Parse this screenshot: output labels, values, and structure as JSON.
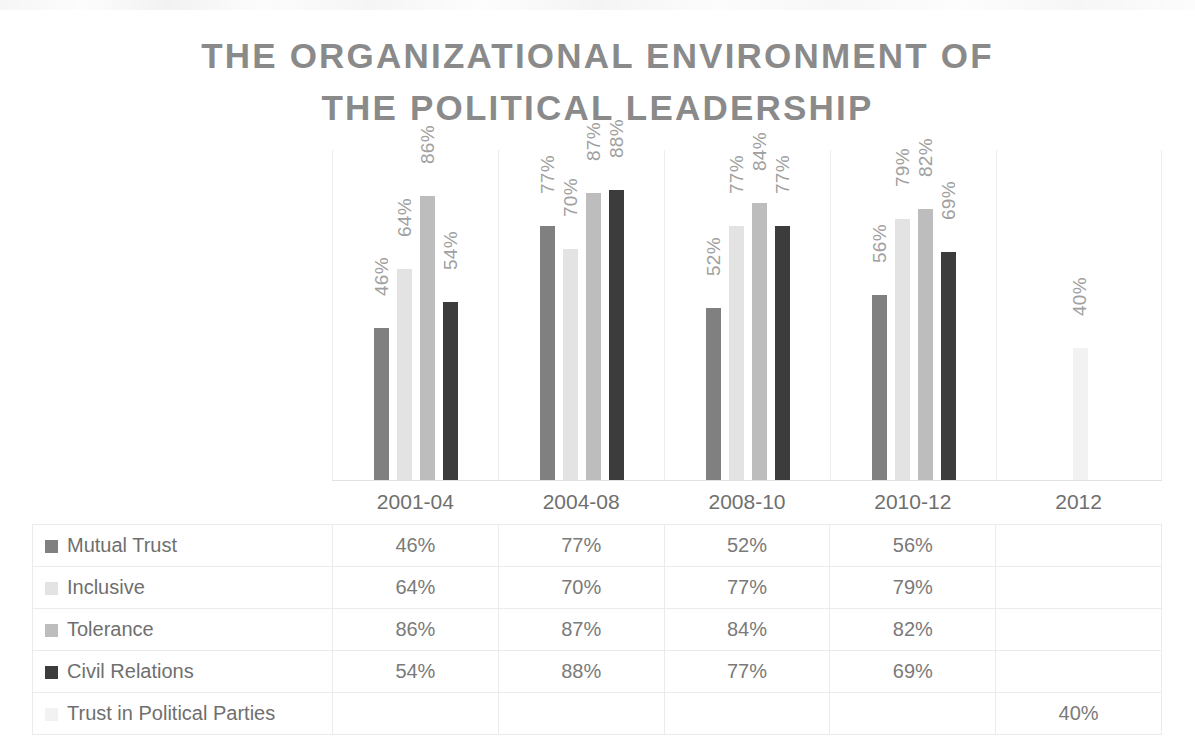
{
  "title": {
    "line1": "THE ORGANIZATIONAL ENVIRONMENT OF",
    "line2": "THE POLITICAL LEADERSHIP"
  },
  "chart_data": {
    "type": "bar",
    "title": "THE ORGANIZATIONAL ENVIRONMENT OF THE POLITICAL LEADERSHIP",
    "xlabel": "",
    "ylabel": "",
    "ylim": [
      0,
      100
    ],
    "grid": false,
    "legend_position": "table-left",
    "value_suffix": "%",
    "categories": [
      "2001-04",
      "2004-08",
      "2008-10",
      "2010-12",
      "2012"
    ],
    "series": [
      {
        "name": "Mutual Trust",
        "color": "#808080",
        "values": [
          46,
          77,
          52,
          56,
          null
        ],
        "labels": [
          "46%",
          "77%",
          "52%",
          "56%",
          ""
        ]
      },
      {
        "name": "Inclusive",
        "color": "#e3e3e3",
        "values": [
          64,
          70,
          77,
          79,
          null
        ],
        "labels": [
          "64%",
          "70%",
          "77%",
          "79%",
          ""
        ]
      },
      {
        "name": "Tolerance",
        "color": "#bdbdbd",
        "values": [
          86,
          87,
          84,
          82,
          null
        ],
        "labels": [
          "86%",
          "87%",
          "84%",
          "82%",
          ""
        ]
      },
      {
        "name": "Civil Relations",
        "color": "#3c3c3c",
        "values": [
          54,
          88,
          77,
          69,
          null
        ],
        "labels": [
          "54%",
          "88%",
          "77%",
          "69%",
          ""
        ]
      },
      {
        "name": "Trust in Political Parties",
        "color": "#f2f2f2",
        "values": [
          null,
          null,
          null,
          null,
          40
        ],
        "labels": [
          "",
          "",
          "",
          "",
          "40%"
        ]
      }
    ]
  },
  "table": {
    "column_headers": [
      "2001-04",
      "2004-08",
      "2008-10",
      "2010-12",
      "2012"
    ],
    "rows": [
      {
        "label": "Mutual Trust",
        "swatch": "#808080",
        "cells": [
          "46%",
          "77%",
          "52%",
          "56%",
          ""
        ]
      },
      {
        "label": "Inclusive",
        "swatch": "#e3e3e3",
        "cells": [
          "64%",
          "70%",
          "77%",
          "79%",
          ""
        ]
      },
      {
        "label": "Tolerance",
        "swatch": "#bdbdbd",
        "cells": [
          "86%",
          "87%",
          "84%",
          "82%",
          ""
        ]
      },
      {
        "label": "Civil Relations",
        "swatch": "#3c3c3c",
        "cells": [
          "54%",
          "88%",
          "77%",
          "69%",
          ""
        ]
      },
      {
        "label": "Trust in Political Parties",
        "swatch": "#f2f2f2",
        "cells": [
          "",
          "",
          "",
          "",
          "40%"
        ]
      }
    ]
  }
}
